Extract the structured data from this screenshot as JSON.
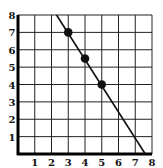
{
  "chart_data": {
    "type": "line",
    "title": "",
    "xlabel": "",
    "ylabel": "",
    "xlim": [
      0,
      8
    ],
    "ylim": [
      0,
      8
    ],
    "grid": true,
    "x_ticks": [
      "1",
      "2",
      "3",
      "4",
      "5",
      "6",
      "7",
      "8"
    ],
    "y_ticks": [
      "1",
      "2",
      "3",
      "4",
      "5",
      "6",
      "7",
      "8"
    ],
    "series": [
      {
        "name": "line",
        "kind": "line",
        "x": [
          2.3,
          7.6
        ],
        "y": [
          8,
          0
        ],
        "slope": -1.5,
        "color": "#111111"
      },
      {
        "name": "points",
        "kind": "scatter",
        "x": [
          3,
          4,
          5
        ],
        "y": [
          7,
          5.5,
          4
        ],
        "color": "#111111"
      }
    ]
  }
}
